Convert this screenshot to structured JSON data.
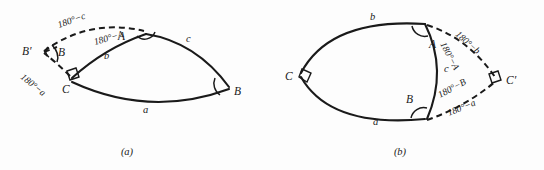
{
  "figure": {
    "caption_a": "(a)",
    "caption_b": "(b)",
    "stroke_color": "#1a1a1a",
    "background_color": "#fdfdfd"
  },
  "panel_a": {
    "caption": "(a)",
    "vertices": [
      {
        "name": "A",
        "label": "A"
      },
      {
        "name": "B",
        "label": "B"
      },
      {
        "name": "C",
        "label": "C"
      },
      {
        "name": "B-prime",
        "label": "B′"
      },
      {
        "name": "B-inner",
        "label": "B"
      }
    ],
    "sides": [
      {
        "name": "side-a",
        "label": "a"
      },
      {
        "name": "side-b",
        "label": "b"
      },
      {
        "name": "side-c",
        "label": "c"
      }
    ],
    "supplements": [
      {
        "name": "supp-c",
        "label": "180°−c"
      },
      {
        "name": "supp-A",
        "label": "180°−A"
      },
      {
        "name": "supp-a",
        "label": "180°−a"
      }
    ],
    "right_angle_vertex": "C"
  },
  "panel_b": {
    "caption": "(b)",
    "vertices": [
      {
        "name": "A",
        "label": "A"
      },
      {
        "name": "B",
        "label": "B"
      },
      {
        "name": "C",
        "label": "C"
      },
      {
        "name": "C-prime",
        "label": "C′"
      }
    ],
    "sides": [
      {
        "name": "side-a",
        "label": "a"
      },
      {
        "name": "side-b",
        "label": "b"
      },
      {
        "name": "side-c",
        "label": "c"
      }
    ],
    "supplements": [
      {
        "name": "supp-b",
        "label": "180°−b"
      },
      {
        "name": "supp-A",
        "label": "180°−A"
      },
      {
        "name": "supp-B",
        "label": "180°−B"
      },
      {
        "name": "supp-a",
        "label": "180°−a"
      }
    ],
    "right_angle_vertices": [
      "C",
      "C′"
    ]
  }
}
